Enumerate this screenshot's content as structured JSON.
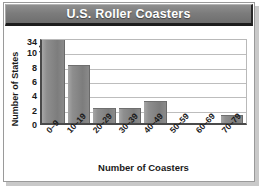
{
  "figure": {
    "title": "U.S. Roller Coasters"
  },
  "chart_data": {
    "type": "bar",
    "title": "U.S. Roller Coasters",
    "xlabel": "Number of Coasters",
    "ylabel": "Number of States",
    "categories": [
      "0–9",
      "10–19",
      "20–29",
      "30–39",
      "40–49",
      "50–59",
      "60–69",
      "70–79"
    ],
    "values": [
      34,
      8,
      2,
      2,
      3,
      0,
      0,
      1
    ],
    "ylim": [
      0,
      12
    ],
    "yticks": [
      "0",
      "2",
      "4",
      "6",
      "8",
      "10",
      "34"
    ],
    "y_axis_break": true,
    "y_axis_break_note": "Axis is broken between 10 and 34; the 34 tick sits directly above 10.",
    "grid": true,
    "grid_axis": "y",
    "legend": "none",
    "bar_color": "#8a8a8a",
    "plot_background": "#ffffff",
    "title_background": "#7c7c7c",
    "title_color": "#ffffff"
  }
}
